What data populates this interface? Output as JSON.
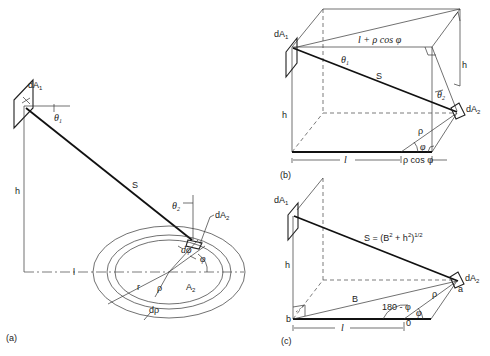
{
  "figure": {
    "panels": [
      {
        "id": "a",
        "caption": "(a)",
        "labels": {
          "dA1": "dA",
          "dA1_sub": "1",
          "theta1": "θ",
          "theta1_sub": "1",
          "h": "h",
          "S": "S",
          "theta2": "θ",
          "theta2_sub": "2",
          "dA2": "dA",
          "dA2_sub": "2",
          "dphi": "dφ",
          "phi": "φ",
          "l": "l",
          "r": "r",
          "rho": "ρ",
          "A2": "A",
          "A2_sub": "2",
          "drho": "dρ"
        }
      },
      {
        "id": "b",
        "caption": "(b)",
        "labels": {
          "dA1": "dA",
          "dA1_sub": "1",
          "l_plus": "l + ρ cos φ",
          "theta1": "θ",
          "theta1_sub": "1",
          "S": "S",
          "h_left": "h",
          "h_right": "h",
          "theta2": "θ",
          "theta2_sub": "2",
          "dA2": "dA",
          "dA2_sub": "2",
          "rho": "ρ",
          "phi": "φ",
          "l": "l",
          "rho_cos": "ρ cos φ"
        }
      },
      {
        "id": "c",
        "caption": "(c)",
        "labels": {
          "dA1": "dA",
          "dA1_sub": "1",
          "S_eq": "S = (B",
          "S_eq_sup1": "2",
          "S_eq_mid": " + h",
          "S_eq_sup2": "2",
          "S_eq_end": ")",
          "S_eq_sup3": "1/2",
          "h": "h",
          "B": "B",
          "dA2": "dA",
          "dA2_sub": "2",
          "a": "a",
          "rho": "ρ",
          "angle": "180 - φ",
          "phi": "φ",
          "b": "b",
          "l": "l",
          "zero": "0"
        }
      }
    ]
  }
}
